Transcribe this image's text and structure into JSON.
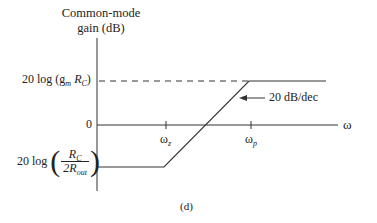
{
  "diagram": {
    "y_axis_label_line1": "Common-mode",
    "y_axis_label_line2": "gain (dB)",
    "x_axis_label": "ω",
    "upper_level": {
      "prefix": "20 log (g",
      "sub1": "m",
      "mid": " R",
      "sub2": "C",
      "suffix": ")"
    },
    "zero_label": "0",
    "lower_level": {
      "prefix": "20 log",
      "num_main": "R",
      "num_sub": "C",
      "den_main": "2R",
      "den_sub": "out"
    },
    "tick_z": {
      "main": "ω",
      "sub": "z"
    },
    "tick_p": {
      "main": "ω",
      "sub": "p"
    },
    "slope_annotation": "20 dB/dec",
    "caption": "(d)",
    "line_color": "#333333"
  }
}
